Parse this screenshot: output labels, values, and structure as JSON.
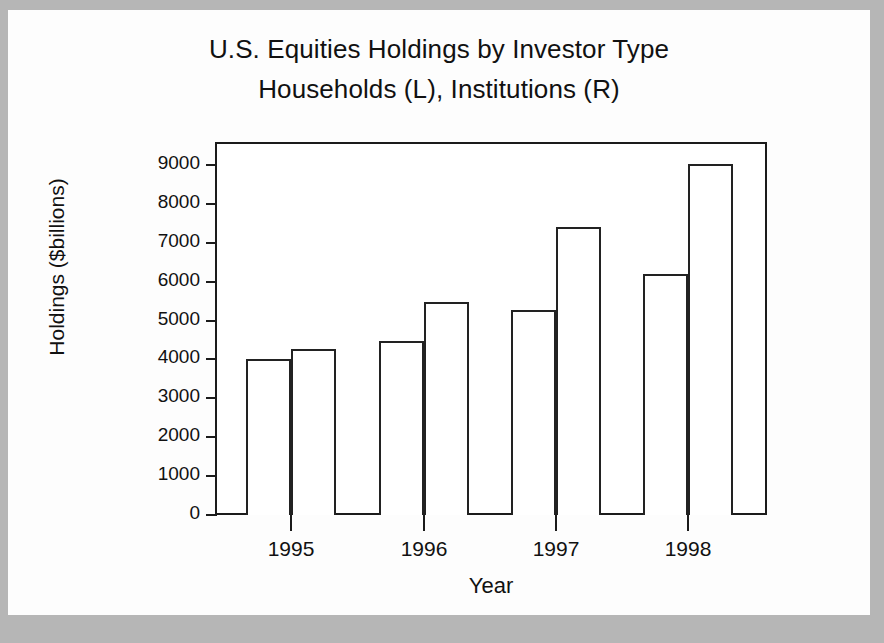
{
  "figure": {
    "title_line_1": "U.S. Equities Holdings by Investor Type",
    "title_line_2": "Households (L), Institutions (R)",
    "background_color": "#b6b6b6",
    "sheet_color": "#fdfdfd",
    "axis_color": "#1b1b1b",
    "bar_fill_color": "#ffffff",
    "bar_edge_color": "#222222"
  },
  "chart_data": {
    "type": "bar",
    "title": "U.S. Equities Holdings by Investor Type\nHouseholds (L), Institutions (R)",
    "xlabel": "Year",
    "ylabel": "Holdings ($billions)",
    "categories": [
      "1995",
      "1996",
      "1997",
      "1998"
    ],
    "series": [
      {
        "name": "Households (L)",
        "values": [
          4000,
          4480,
          5280,
          6200
        ]
      },
      {
        "name": "Institutions (R)",
        "values": [
          4280,
          5480,
          7400,
          9020
        ]
      }
    ],
    "ylim": [
      0,
      9400
    ],
    "yticks": [
      0,
      1000,
      2000,
      3000,
      4000,
      5000,
      6000,
      7000,
      8000,
      9000
    ],
    "ytick_labels": [
      "0",
      "1000",
      "2000",
      "3000",
      "4000",
      "5000",
      "6000",
      "7000",
      "8000",
      "9000"
    ],
    "grid": false,
    "legend": "none",
    "bar_style": "unfilled-outline-grouped"
  }
}
